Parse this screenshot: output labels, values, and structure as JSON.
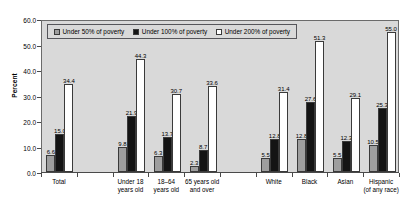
{
  "chart_data": {
    "type": "bar",
    "title": "",
    "xlabel": "",
    "ylabel": "Percent",
    "ylim": [
      0,
      60
    ],
    "ytick_step": 10,
    "ytick_labels": [
      "0.0",
      "10.0",
      "20.0",
      "30.0",
      "40.0",
      "50.0",
      "60.0"
    ],
    "grid": false,
    "legend_position": "top-left-inside",
    "categories": [
      "Total",
      "Under 18\nyears old",
      "18–64\nyears old",
      "65 years old\nand over",
      "White",
      "Black",
      "Asian",
      "Hispanic\n(of any race)"
    ],
    "series": [
      {
        "name": "Under 50% of poverty",
        "color": "#9e9e9e",
        "values": [
          6.6,
          9.8,
          6.3,
          2.3,
          5.5,
          12.8,
          5.5,
          10.5
        ]
      },
      {
        "name": "Under 100% of poverty",
        "color": "#141414",
        "values": [
          15.0,
          21.9,
          13.7,
          8.7,
          12.8,
          27.6,
          12.3,
          25.3
        ]
      },
      {
        "name": "Under 200% of poverty",
        "color": "#ffffff",
        "values": [
          34.4,
          44.3,
          30.7,
          33.6,
          31.4,
          51.3,
          29.1,
          55.0
        ]
      }
    ],
    "plot_background": "#d9d9d9",
    "axis_color": "#4a4a4a"
  },
  "legend": {
    "items": [
      {
        "label": "Under 50% of poverty"
      },
      {
        "label": "Under 100% of poverty"
      },
      {
        "label": "Under 200% of poverty"
      }
    ]
  }
}
